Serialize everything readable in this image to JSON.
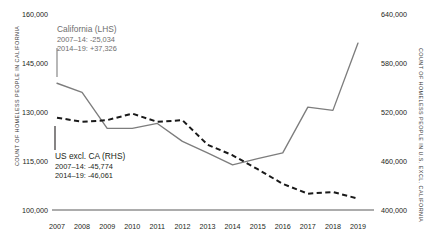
{
  "chart_data": {
    "type": "line",
    "title": "",
    "subtitle": "",
    "xlabel": "",
    "categories": [
      "2007",
      "2008",
      "2009",
      "2010",
      "2011",
      "2012",
      "2013",
      "2014",
      "2015",
      "2016",
      "2017",
      "2018",
      "2019"
    ],
    "grid": false,
    "legend_position": "inline-annotation",
    "axes": {
      "left": {
        "label": "COUNT OF HOMELESS PEOPLE IN CALIFORNIA",
        "ticks": [
          "160,000",
          "145,000",
          "130,000",
          "115,000",
          "100,000"
        ],
        "tick_values": [
          160000,
          145000,
          130000,
          115000,
          100000
        ],
        "ylim": [
          100000,
          160000
        ]
      },
      "right": {
        "label": "COUNT OF HOMELESS PEOPLE IN U.S. EXCL. CALIFORNIA",
        "ticks": [
          "640,000",
          "580,000",
          "520,000",
          "460,000",
          "400,000"
        ],
        "tick_values": [
          640000,
          580000,
          520000,
          460000,
          400000
        ],
        "ylim": [
          400000,
          640000
        ]
      }
    },
    "series": [
      {
        "name": "California (LHS)",
        "axis": "left",
        "style": "solid",
        "color": "#7d7d7d",
        "values": [
          138800,
          136000,
          125000,
          125000,
          126500,
          121000,
          117500,
          113800,
          115700,
          117500,
          131500,
          130500,
          151100
        ]
      },
      {
        "name": "US excl. CA (RHS)",
        "axis": "right",
        "style": "dashed",
        "color": "#1a1a1a",
        "values": [
          513000,
          508000,
          510000,
          518000,
          508000,
          510000,
          480000,
          467000,
          450000,
          432000,
          420000,
          422000,
          414000
        ]
      }
    ],
    "annotations": [
      {
        "id": "california",
        "title": "California (LHS)",
        "rows": [
          "2007–14:  -25,034",
          "2014–19: +37,326"
        ],
        "color": "#6e6e6e"
      },
      {
        "id": "us-excl-ca",
        "title": "US excl. CA (RHS)",
        "rows": [
          "2007–14: -45,774",
          "2014–19: -46,061"
        ],
        "color": "#231f20"
      }
    ]
  }
}
